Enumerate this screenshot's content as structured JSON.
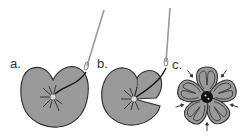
{
  "figure": {
    "top_text_cutoff": "",
    "panels": [
      {
        "label": "a.",
        "description": "circle of fabric gathered, needle pulling thread from center to edge"
      },
      {
        "label": "b.",
        "description": "thread pulled across, creating a petal indentation"
      },
      {
        "label": "c.",
        "description": "finished five-petal flower with button center, arrows indicating petal gathers"
      }
    ],
    "colors": {
      "fabric": "#9a9a9a",
      "outline": "#333333",
      "thread": "#1a1a1a",
      "needle": "#a8a8a8",
      "center_dot": "#d9d9d9",
      "button": "#111111",
      "background": "#ffffff"
    }
  }
}
